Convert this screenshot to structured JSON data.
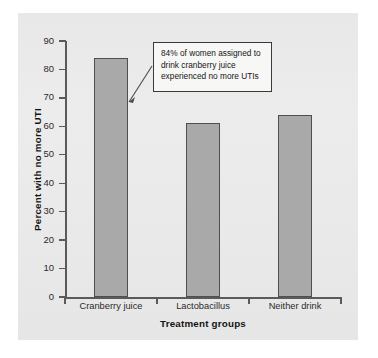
{
  "figure": {
    "background_color": "#e9e9e9",
    "page_color": "#ffffff"
  },
  "annotation": {
    "text": "84% of women assigned to drink cranberry juice experienced no more UTIs",
    "line1": "84% of women assigned to",
    "line2": "drink cranberry juice",
    "line3": "experienced no more UTIs",
    "points_to": "Cranberry juice"
  },
  "chart_data": {
    "type": "bar",
    "title": "",
    "xlabel": "Treatment groups",
    "ylabel": "Percent with no more UTI",
    "categories": [
      "Cranberry juice",
      "Lactobacillus",
      "Neither drink"
    ],
    "values": [
      84,
      61,
      64
    ],
    "ylim": [
      0,
      90
    ],
    "yticks": [
      0,
      10,
      20,
      30,
      40,
      50,
      60,
      70,
      80,
      90
    ],
    "ytick_labels": [
      "0",
      "10",
      "20",
      "30",
      "40",
      "50",
      "60",
      "70",
      "80",
      "90"
    ],
    "grid": false,
    "legend": null,
    "bar_fill_color": "#a9a9a9",
    "bar_edge_color": "#4f4f4f",
    "axis_color": "#5a5a5a",
    "annotations": [
      {
        "text": "84% of women assigned to drink cranberry juice experienced no more UTIs",
        "target_category": "Cranberry juice",
        "target_value": 84
      }
    ]
  },
  "bleed_through": {
    "line1": "",
    "line2": "",
    "line3": "",
    "line4": ""
  }
}
